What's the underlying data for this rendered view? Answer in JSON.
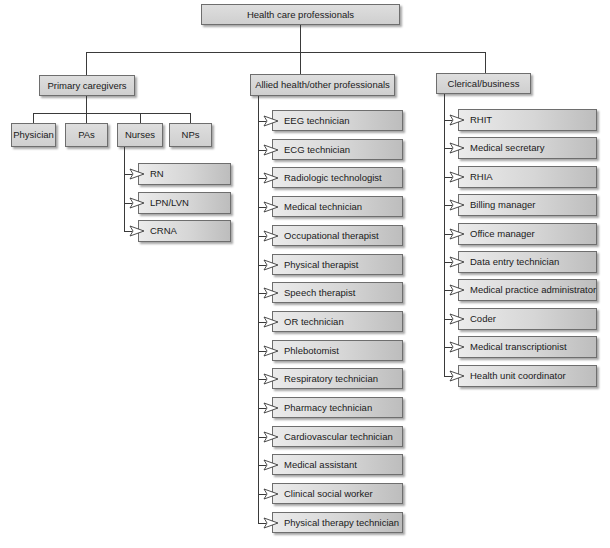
{
  "root": {
    "label": "Health care professionals"
  },
  "categories": [
    {
      "label": "Primary caregivers",
      "children": [
        {
          "label": "Physician"
        },
        {
          "label": "PAs"
        },
        {
          "label": "Nurses",
          "children": [
            {
              "label": "RN"
            },
            {
              "label": "LPN/LVN"
            },
            {
              "label": "CRNA"
            }
          ]
        },
        {
          "label": "NPs"
        }
      ]
    },
    {
      "label": "Allied health/other professionals",
      "children": [
        {
          "label": "EEG technician"
        },
        {
          "label": "ECG technician"
        },
        {
          "label": "Radiologic technologist"
        },
        {
          "label": "Medical technician"
        },
        {
          "label": "Occupational therapist"
        },
        {
          "label": "Physical therapist"
        },
        {
          "label": "Speech therapist"
        },
        {
          "label": "OR technician"
        },
        {
          "label": "Phlebotomist"
        },
        {
          "label": "Respiratory technician"
        },
        {
          "label": "Pharmacy technician"
        },
        {
          "label": "Cardiovascular technician"
        },
        {
          "label": "Medical assistant"
        },
        {
          "label": "Clinical social worker"
        },
        {
          "label": "Physical therapy technician"
        }
      ]
    },
    {
      "label": "Clerical/business",
      "children": [
        {
          "label": "RHIT"
        },
        {
          "label": "Medical secretary"
        },
        {
          "label": "RHIA"
        },
        {
          "label": "Billing manager"
        },
        {
          "label": "Office manager"
        },
        {
          "label": "Data entry technician"
        },
        {
          "label": "Medical practice administrator"
        },
        {
          "label": "Coder"
        },
        {
          "label": "Medical transcriptionist"
        },
        {
          "label": "Health unit coordinator"
        }
      ]
    }
  ],
  "colors": {
    "box_light": "#ebebeb",
    "box_dark": "#bdbdbd",
    "line": "#3a3a3a",
    "arrow_fill": "#ffffff"
  },
  "icons": {
    "connector_arrow": "hollow-right-triangle"
  }
}
